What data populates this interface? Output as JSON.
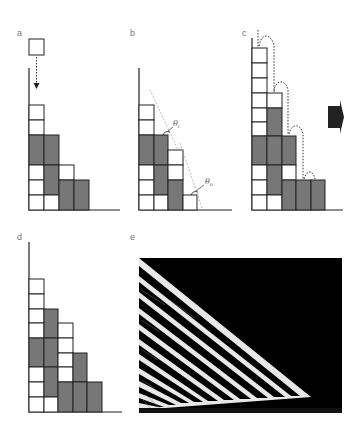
{
  "figure": {
    "panels": [
      {
        "id": "a",
        "label": "a"
      },
      {
        "id": "b",
        "label": "b",
        "angle_labels": {
          "inner": {
            "symbol": "θ",
            "subscript": "i"
          },
          "outer": {
            "symbol": "θ",
            "subscript": "o"
          }
        }
      },
      {
        "id": "c",
        "label": "c"
      },
      {
        "id": "d",
        "label": "d"
      },
      {
        "id": "e",
        "label": "e"
      }
    ],
    "colors": {
      "cell_empty": "#ffffff",
      "cell_filled": "#777777",
      "outline": "#222222",
      "arrow": "#222222",
      "simulation_background": "#000000",
      "simulation_stripes": "#ffffff"
    }
  }
}
